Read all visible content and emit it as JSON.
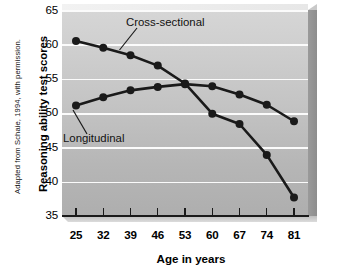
{
  "credit": "Adapted from Schaie, 1994, with permission.",
  "axes": {
    "ylabel": "Reasoning ability test scores",
    "xlabel": "Age in years",
    "yticks": [
      "65",
      "60",
      "55",
      "50",
      "45",
      "40",
      "35"
    ],
    "xticks": [
      "25",
      "32",
      "39",
      "46",
      "53",
      "60",
      "67",
      "74",
      "81"
    ]
  },
  "annotations": {
    "cross_sectional": "Cross-sectional",
    "longitudinal": "Longitudinal"
  },
  "colors": {
    "line": "#1a1a1a",
    "marker": "#1a1a1a",
    "gridline": "#fbfbfb",
    "panel_top": "#d6d6d6",
    "panel_bottom": "#aeaeae"
  },
  "chart_data": {
    "type": "line",
    "title": "",
    "xlabel": "Age in years",
    "ylabel": "Reasoning ability test scores",
    "x": [
      25,
      32,
      39,
      46,
      53,
      60,
      67,
      74,
      81
    ],
    "xlim": [
      25,
      81
    ],
    "ylim": [
      35,
      65
    ],
    "yticks": [
      35,
      40,
      45,
      50,
      55,
      60,
      65
    ],
    "grid": true,
    "legend": "inline-annotations",
    "series": [
      {
        "name": "Cross-sectional",
        "values": [
          60.5,
          59.5,
          58.4,
          56.9,
          54.3,
          49.9,
          48.4,
          43.9,
          37.7
        ]
      },
      {
        "name": "Longitudinal",
        "values": [
          51.1,
          52.3,
          53.3,
          53.8,
          54.2,
          53.9,
          52.7,
          51.2,
          48.8
        ]
      }
    ]
  }
}
